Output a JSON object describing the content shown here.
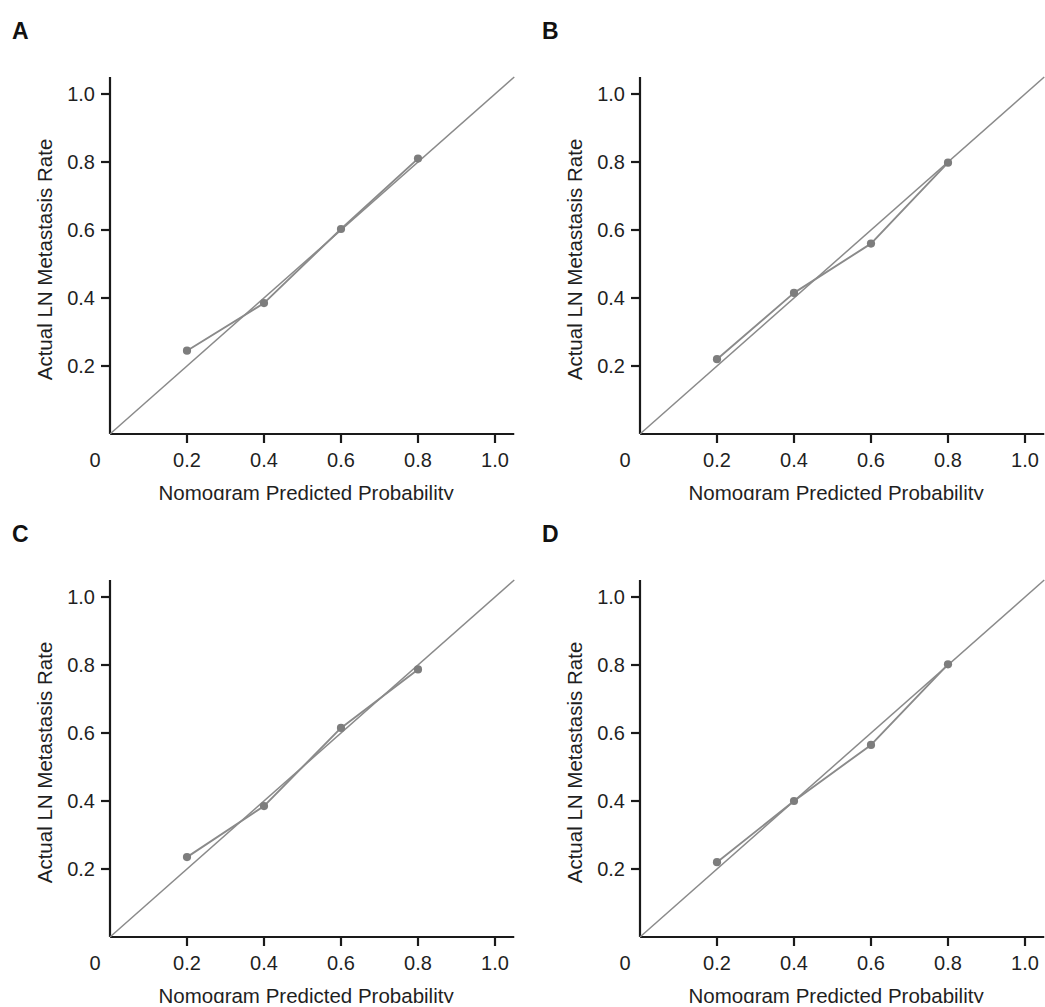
{
  "figure": {
    "panels": [
      {
        "letter": "A",
        "xlabel": "Nomogram Predicted Probability",
        "ylabel": "Actual LN Metastasis Rate"
      },
      {
        "letter": "B",
        "xlabel": "Nomogram Predicted Probability",
        "ylabel": "Actual LN Metastasis Rate"
      },
      {
        "letter": "C",
        "xlabel": "Nomogram Predicted Probability",
        "ylabel": "Actual LN Metastasis Rate"
      },
      {
        "letter": "D",
        "xlabel": "Nomogram Predicted Probability",
        "ylabel": "Actual LN Metastasis Rate"
      }
    ],
    "colors": {
      "axis": "#1a1a1a",
      "reference_line": "#8a8a8a",
      "calibration_line": "#8a8a8a",
      "marker": "#7d7d7d",
      "background": "#ffffff"
    }
  },
  "chart_data": [
    {
      "type": "line",
      "panel": "A",
      "title": "A",
      "xlabel": "Nomogram Predicted Probability",
      "ylabel": "Actual LN Metastasis Rate",
      "xlim": [
        0,
        1.05
      ],
      "ylim": [
        0,
        1.05
      ],
      "xticks": [
        0.2,
        0.4,
        0.6,
        0.8,
        1.0
      ],
      "xticklabels": [
        "0.2",
        "0.4",
        "0.6",
        "0.8",
        "1.0"
      ],
      "x_origin_label": "0",
      "yticks": [
        0.2,
        0.4,
        0.6,
        0.8,
        1.0
      ],
      "yticklabels": [
        "0.2",
        "0.4",
        "0.6",
        "0.8",
        "1.0"
      ],
      "grid": false,
      "legend": "none",
      "series": [
        {
          "name": "Reference (ideal)",
          "style": "diagonal-reference",
          "x": [
            0.0,
            1.05
          ],
          "y": [
            0.0,
            1.05
          ]
        },
        {
          "name": "Apparent calibration",
          "style": "line-with-markers",
          "x": [
            0.2,
            0.4,
            0.6,
            0.8
          ],
          "y": [
            0.245,
            0.385,
            0.603,
            0.81
          ]
        }
      ]
    },
    {
      "type": "line",
      "panel": "B",
      "title": "B",
      "xlabel": "Nomogram Predicted Probability",
      "ylabel": "Actual LN Metastasis Rate",
      "xlim": [
        0,
        1.05
      ],
      "ylim": [
        0,
        1.05
      ],
      "xticks": [
        0.2,
        0.4,
        0.6,
        0.8,
        1.0
      ],
      "xticklabels": [
        "0.2",
        "0.4",
        "0.6",
        "0.8",
        "1.0"
      ],
      "x_origin_label": "0",
      "yticks": [
        0.2,
        0.4,
        0.6,
        0.8,
        1.0
      ],
      "yticklabels": [
        "0.2",
        "0.4",
        "0.6",
        "0.8",
        "1.0"
      ],
      "grid": false,
      "legend": "none",
      "series": [
        {
          "name": "Reference (ideal)",
          "style": "diagonal-reference",
          "x": [
            0.0,
            1.05
          ],
          "y": [
            0.0,
            1.05
          ]
        },
        {
          "name": "Apparent calibration",
          "style": "line-with-markers",
          "x": [
            0.2,
            0.4,
            0.6,
            0.8
          ],
          "y": [
            0.22,
            0.415,
            0.56,
            0.798
          ]
        }
      ]
    },
    {
      "type": "line",
      "panel": "C",
      "title": "C",
      "xlabel": "Nomogram Predicted Probability",
      "ylabel": "Actual LN Metastasis Rate",
      "xlim": [
        0,
        1.05
      ],
      "ylim": [
        0,
        1.05
      ],
      "xticks": [
        0.2,
        0.4,
        0.6,
        0.8,
        1.0
      ],
      "xticklabels": [
        "0.2",
        "0.4",
        "0.6",
        "0.8",
        "1.0"
      ],
      "x_origin_label": "0",
      "yticks": [
        0.2,
        0.4,
        0.6,
        0.8,
        1.0
      ],
      "yticklabels": [
        "0.2",
        "0.4",
        "0.6",
        "0.8",
        "1.0"
      ],
      "grid": false,
      "legend": "none",
      "series": [
        {
          "name": "Reference (ideal)",
          "style": "diagonal-reference",
          "x": [
            0.0,
            1.05
          ],
          "y": [
            0.0,
            1.05
          ]
        },
        {
          "name": "Apparent calibration",
          "style": "line-with-markers",
          "x": [
            0.2,
            0.4,
            0.6,
            0.8
          ],
          "y": [
            0.235,
            0.385,
            0.615,
            0.787
          ]
        }
      ]
    },
    {
      "type": "line",
      "panel": "D",
      "title": "D",
      "xlabel": "Nomogram Predicted Probability",
      "ylabel": "Actual LN Metastasis Rate",
      "xlim": [
        0,
        1.05
      ],
      "ylim": [
        0,
        1.05
      ],
      "xticks": [
        0.2,
        0.4,
        0.6,
        0.8,
        1.0
      ],
      "xticklabels": [
        "0.2",
        "0.4",
        "0.6",
        "0.8",
        "1.0"
      ],
      "x_origin_label": "0",
      "yticks": [
        0.2,
        0.4,
        0.6,
        0.8,
        1.0
      ],
      "yticklabels": [
        "0.2",
        "0.4",
        "0.6",
        "0.8",
        "1.0"
      ],
      "grid": false,
      "legend": "none",
      "series": [
        {
          "name": "Reference (ideal)",
          "style": "diagonal-reference",
          "x": [
            0.0,
            1.05
          ],
          "y": [
            0.0,
            1.05
          ]
        },
        {
          "name": "Apparent calibration",
          "style": "line-with-markers",
          "x": [
            0.2,
            0.4,
            0.6,
            0.8
          ],
          "y": [
            0.22,
            0.4,
            0.565,
            0.802
          ]
        }
      ]
    }
  ]
}
